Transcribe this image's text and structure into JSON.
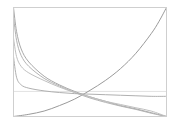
{
  "chart_data": {
    "type": "line",
    "title": "",
    "xlabel": "",
    "ylabel": "",
    "xlim": [
      0,
      1
    ],
    "ylim": [
      0,
      1
    ],
    "grid": false,
    "legend": null,
    "frame": {
      "x": 13,
      "y": 7,
      "width": 153,
      "height": 109,
      "color": "#cfcfcf"
    },
    "reference_lines": [
      {
        "orientation": "horizontal",
        "y": 0.23,
        "color": "#e2e2e2"
      }
    ],
    "series": [
      {
        "name": "increasing",
        "color": "#9a9a9a",
        "x": [
          0,
          0.1,
          0.2,
          0.3,
          0.4,
          0.5,
          0.6,
          0.7,
          0.8,
          0.9,
          0.95,
          1.0
        ],
        "y": [
          0.0,
          0.02,
          0.05,
          0.1,
          0.16,
          0.24,
          0.33,
          0.44,
          0.58,
          0.76,
          0.87,
          1.0
        ]
      },
      {
        "name": "decreasing-1",
        "color": "#a8a8a8",
        "x": [
          0,
          0.02,
          0.05,
          0.1,
          0.2,
          0.3,
          0.4,
          0.5,
          0.6,
          0.7,
          0.8,
          0.9,
          1.0
        ],
        "y": [
          1.0,
          0.78,
          0.62,
          0.5,
          0.37,
          0.29,
          0.23,
          0.18,
          0.14,
          0.1,
          0.07,
          0.035,
          0.0
        ]
      },
      {
        "name": "decreasing-2",
        "color": "#b4b4b4",
        "x": [
          0,
          0.02,
          0.05,
          0.1,
          0.2,
          0.3,
          0.4,
          0.5,
          0.6,
          0.7,
          0.8,
          0.9,
          1.0
        ],
        "y": [
          0.92,
          0.7,
          0.56,
          0.46,
          0.35,
          0.28,
          0.22,
          0.17,
          0.13,
          0.095,
          0.065,
          0.03,
          0.0
        ]
      },
      {
        "name": "decreasing-3",
        "color": "#c0c0c0",
        "x": [
          0,
          0.02,
          0.05,
          0.1,
          0.2,
          0.3,
          0.4,
          0.5,
          0.6,
          0.7,
          0.8,
          0.9,
          1.0
        ],
        "y": [
          0.72,
          0.55,
          0.46,
          0.4,
          0.33,
          0.27,
          0.22,
          0.18,
          0.14,
          0.11,
          0.08,
          0.05,
          0.0
        ]
      },
      {
        "name": "flattening",
        "color": "#b0b0b0",
        "x": [
          0,
          0.02,
          0.05,
          0.1,
          0.2,
          0.3,
          0.4,
          0.5,
          0.6,
          0.7,
          0.8,
          0.9,
          1.0
        ],
        "y": [
          0.55,
          0.36,
          0.29,
          0.26,
          0.235,
          0.22,
          0.21,
          0.205,
          0.2,
          0.195,
          0.19,
          0.185,
          0.185
        ]
      }
    ]
  }
}
